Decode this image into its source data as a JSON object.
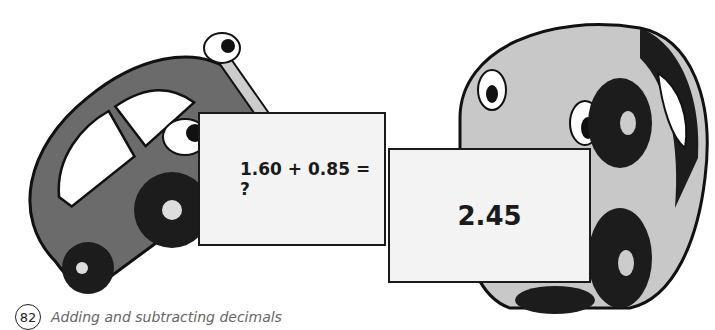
{
  "illustration": {
    "left_car": {
      "description": "dark grey cartoon car tilted, holding card"
    },
    "right_car": {
      "description": "light grey cartoon car upright, holding card"
    }
  },
  "cards": {
    "question": "1.60 + 0.85 = ?",
    "answer": "2.45"
  },
  "footer": {
    "page_number": "82",
    "title": "Adding and subtracting decimals"
  },
  "colors": {
    "left_car_body": "#6b6b6b",
    "right_car_body": "#c8c8c8",
    "card_bg": "#f3f3f3",
    "outline": "#1a1a1a"
  }
}
